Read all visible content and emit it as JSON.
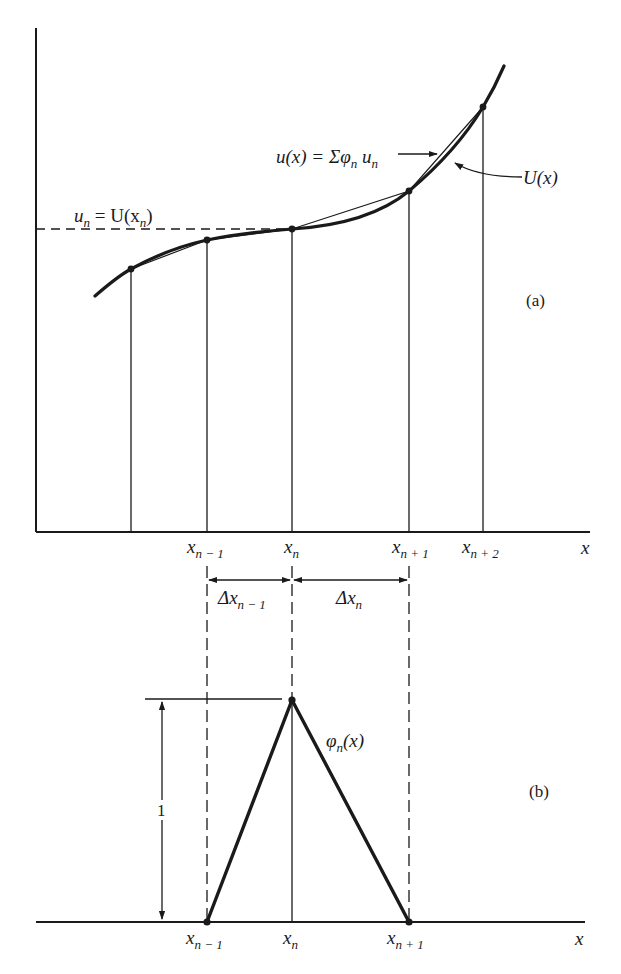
{
  "figure": {
    "panel_a": {
      "label": "(a)",
      "axis_x_label": "x",
      "equation_un": {
        "lhs": "u",
        "lhs_sub": "n",
        "eq": " = U(x",
        "sub": "n",
        "close": ")"
      },
      "equation_ux": {
        "lhs": "u(x) = Σφ",
        "sub1": "n",
        "mid": " u",
        "sub2": "n"
      },
      "curve_label": "U(x)",
      "ticks": [
        {
          "base": "x",
          "sub": "n − 1"
        },
        {
          "base": "x",
          "sub": "n"
        },
        {
          "base": "x",
          "sub": "n + 1"
        },
        {
          "base": "x",
          "sub": "n + 2"
        }
      ],
      "intervals": [
        {
          "base": "Δx",
          "sub": "n − 1"
        },
        {
          "base": "Δx",
          "sub": "n"
        }
      ]
    },
    "panel_b": {
      "label": "(b)",
      "axis_x_label": "x",
      "basis_label": {
        "base": "φ",
        "sub": "n",
        "arg": "(x)"
      },
      "height_label": "1",
      "ticks": [
        {
          "base": "x",
          "sub": "n − 1"
        },
        {
          "base": "x",
          "sub": "n"
        },
        {
          "base": "x",
          "sub": "n + 1"
        }
      ]
    },
    "colors": {
      "ink": "#1a1a1a",
      "background": "#ffffff"
    }
  }
}
